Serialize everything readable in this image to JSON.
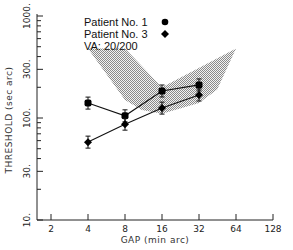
{
  "chart_data": {
    "type": "line",
    "title": "",
    "xlabel": "GAP (min arc)",
    "ylabel": "THRESHOLD (sec arc)",
    "x_scale": "log2",
    "y_scale": "log10",
    "x_ticks": [
      2,
      4,
      8,
      16,
      32,
      64,
      128
    ],
    "x_tick_labels": [
      "2",
      "4",
      "8",
      "16",
      "32",
      "64",
      "128"
    ],
    "y_ticks": [
      10,
      30,
      100,
      300,
      1000
    ],
    "y_tick_labels": [
      "10.",
      "30.",
      "100.",
      "300.",
      "1000."
    ],
    "xlim": [
      2,
      128
    ],
    "ylim": [
      10,
      1000
    ],
    "grid": false,
    "legend_position": "upper-center",
    "series": [
      {
        "name": "Patient No. 1",
        "marker": "circle",
        "x": [
          4,
          8,
          16,
          32
        ],
        "values": [
          140,
          105,
          184,
          211
        ]
      },
      {
        "name": "Patient No. 3",
        "marker": "diamond",
        "x": [
          4,
          8,
          16,
          32
        ],
        "values": [
          58,
          87,
          125,
          168
        ]
      }
    ],
    "annotations": [
      "VA: 20/200"
    ],
    "shaded_region": {
      "description": "Normal range band (stippled)",
      "polygon_approx": [
        [
          4,
          480
        ],
        [
          8,
          480
        ],
        [
          16,
          200
        ],
        [
          64,
          480
        ],
        [
          45,
          190
        ],
        [
          32,
          140
        ],
        [
          16,
          110
        ],
        [
          11,
          120
        ],
        [
          8,
          150
        ]
      ]
    }
  },
  "legend": {
    "items": [
      {
        "label": "Patient No. 1",
        "marker": "●"
      },
      {
        "label": "Patient No. 3",
        "marker": "◆"
      }
    ],
    "note": "VA: 20/200"
  },
  "axes": {
    "x_title": "GAP (min arc)",
    "y_title": "THRESHOLD (sec arc)"
  }
}
